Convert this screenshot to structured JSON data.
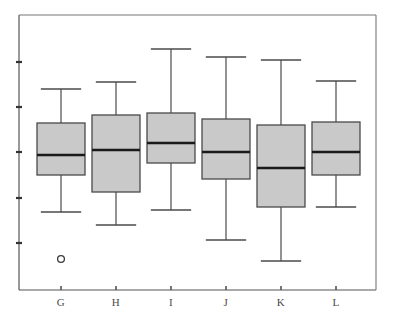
{
  "chart_data": {
    "type": "box",
    "title": "",
    "subtitle": "",
    "xlabel": "",
    "ylabel": "",
    "categories": [
      "G",
      "H",
      "I",
      "J",
      "K",
      "L"
    ],
    "grid": false,
    "legend": false,
    "legend_position": "none",
    "y_axis": {
      "labels_shown": false,
      "tick_count": 5,
      "tick_pixel_positions": [
        62,
        107,
        152,
        198,
        243
      ],
      "axis_pixel_range": [
        15,
        290
      ]
    },
    "x_axis": {
      "tick_pixel_positions": [
        61,
        116,
        171,
        226,
        281,
        336
      ],
      "axis_pixel_y": 290
    },
    "colors": {
      "box_fill": "#c9c9c9",
      "box_edge": "#4a4a4a",
      "median": "#1a1a1a",
      "whisker": "#4a4a4a",
      "outlier": "#3a3a3a",
      "frame": "#777777",
      "background": "#ffffff"
    },
    "boxes": [
      {
        "category": "G",
        "center_px": 61,
        "box_left_px": 37,
        "box_right_px": 85,
        "whisker_high_px": 89,
        "q3_px": 123,
        "median_px": 155,
        "q1_px": 175,
        "whisker_low_px": 212,
        "outliers_px": [
          259
        ]
      },
      {
        "category": "H",
        "center_px": 116,
        "box_left_px": 92,
        "box_right_px": 140,
        "whisker_high_px": 82,
        "q3_px": 115,
        "median_px": 150,
        "q1_px": 192,
        "whisker_low_px": 225,
        "outliers_px": []
      },
      {
        "category": "I",
        "center_px": 171,
        "box_left_px": 147,
        "box_right_px": 195,
        "whisker_high_px": 49,
        "q3_px": 113,
        "median_px": 143,
        "q1_px": 163,
        "whisker_low_px": 210,
        "outliers_px": []
      },
      {
        "category": "J",
        "center_px": 226,
        "box_left_px": 202,
        "box_right_px": 250,
        "whisker_high_px": 57,
        "q3_px": 119,
        "median_px": 152,
        "q1_px": 179,
        "whisker_low_px": 240,
        "outliers_px": []
      },
      {
        "category": "K",
        "center_px": 281,
        "box_left_px": 257,
        "box_right_px": 305,
        "whisker_high_px": 60,
        "q3_px": 125,
        "median_px": 168,
        "q1_px": 207,
        "whisker_low_px": 261,
        "outliers_px": []
      },
      {
        "category": "L",
        "center_px": 336,
        "box_left_px": 312,
        "box_right_px": 360,
        "whisker_high_px": 81,
        "q3_px": 122,
        "median_px": 152,
        "q1_px": 175,
        "whisker_low_px": 207,
        "outliers_px": []
      }
    ]
  },
  "frame": {
    "left_px": 19,
    "right_px": 376,
    "top_px": 15,
    "bottom_px": 290
  }
}
